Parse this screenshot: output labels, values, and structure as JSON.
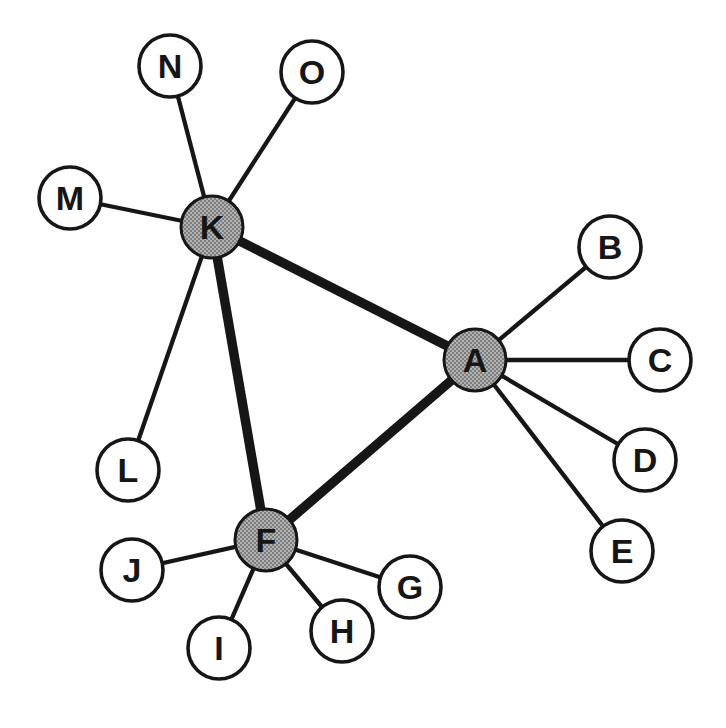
{
  "canvas": {
    "width": 726,
    "height": 728
  },
  "colors": {
    "background": "#ffffff",
    "edge": "#161616",
    "leaf_fill": "#ffffff",
    "hub_halftone_light": "#b2b2b2",
    "hub_halftone_dark": "#7e7e7e",
    "label": "#161616"
  },
  "style": {
    "node_radius": 31,
    "leaf_stroke": 3.6,
    "hub_stroke": 3,
    "thick_width": 9.5,
    "thin_width": 4.3,
    "label_dy": 12
  },
  "graph": {
    "nodes": [
      {
        "id": "K",
        "label": "K",
        "x": 212,
        "y": 227,
        "type": "hub"
      },
      {
        "id": "A",
        "label": "A",
        "x": 475,
        "y": 360,
        "type": "hub"
      },
      {
        "id": "F",
        "label": "F",
        "x": 266,
        "y": 540,
        "type": "hub"
      },
      {
        "id": "N",
        "label": "N",
        "x": 170,
        "y": 66,
        "type": "leaf"
      },
      {
        "id": "O",
        "label": "O",
        "x": 312,
        "y": 72,
        "type": "leaf"
      },
      {
        "id": "M",
        "label": "M",
        "x": 70,
        "y": 198,
        "type": "leaf"
      },
      {
        "id": "L",
        "label": "L",
        "x": 128,
        "y": 470,
        "type": "leaf"
      },
      {
        "id": "B",
        "label": "B",
        "x": 610,
        "y": 247,
        "type": "leaf"
      },
      {
        "id": "C",
        "label": "C",
        "x": 660,
        "y": 360,
        "type": "leaf"
      },
      {
        "id": "D",
        "label": "D",
        "x": 645,
        "y": 460,
        "type": "leaf"
      },
      {
        "id": "E",
        "label": "E",
        "x": 622,
        "y": 551,
        "type": "leaf"
      },
      {
        "id": "J",
        "label": "J",
        "x": 132,
        "y": 570,
        "type": "leaf"
      },
      {
        "id": "I",
        "label": "I",
        "x": 219,
        "y": 648,
        "type": "leaf"
      },
      {
        "id": "H",
        "label": "H",
        "x": 342,
        "y": 631,
        "type": "leaf"
      },
      {
        "id": "G",
        "label": "G",
        "x": 410,
        "y": 587,
        "type": "leaf"
      }
    ],
    "edges": [
      {
        "from": "K",
        "to": "N",
        "weight": "thin"
      },
      {
        "from": "K",
        "to": "O",
        "weight": "thin"
      },
      {
        "from": "K",
        "to": "M",
        "weight": "thin"
      },
      {
        "from": "K",
        "to": "L",
        "weight": "thin"
      },
      {
        "from": "A",
        "to": "B",
        "weight": "thin"
      },
      {
        "from": "A",
        "to": "C",
        "weight": "thin"
      },
      {
        "from": "A",
        "to": "D",
        "weight": "thin"
      },
      {
        "from": "A",
        "to": "E",
        "weight": "thin"
      },
      {
        "from": "F",
        "to": "J",
        "weight": "thin"
      },
      {
        "from": "F",
        "to": "I",
        "weight": "thin"
      },
      {
        "from": "F",
        "to": "H",
        "weight": "thin"
      },
      {
        "from": "F",
        "to": "G",
        "weight": "thin"
      },
      {
        "from": "K",
        "to": "A",
        "weight": "thick"
      },
      {
        "from": "K",
        "to": "F",
        "weight": "thick"
      },
      {
        "from": "F",
        "to": "A",
        "weight": "thick"
      }
    ]
  }
}
